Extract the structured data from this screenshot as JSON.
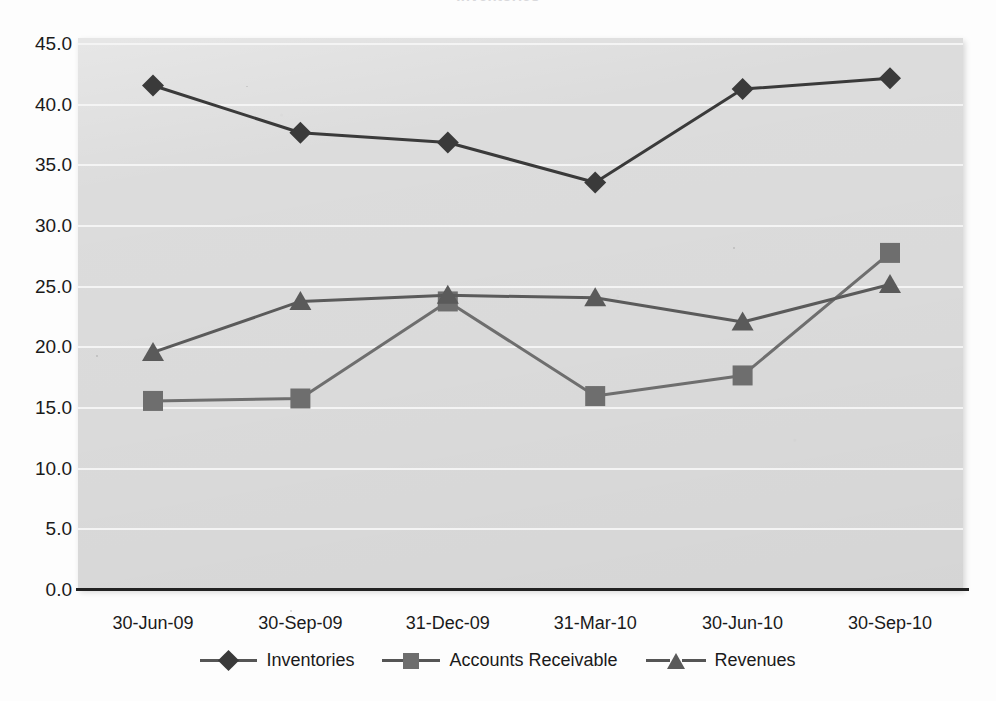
{
  "chart_data": {
    "type": "line",
    "title": "Inventories",
    "title_visible_fragment": "Inventories",
    "xlabel": "",
    "ylabel": "",
    "ylim": [
      0.0,
      45.0
    ],
    "y_ticks": [
      "45.0",
      "40.0",
      "35.0",
      "30.0",
      "25.0",
      "20.0",
      "15.0",
      "10.0",
      "5.0",
      "0.0"
    ],
    "y_tick_values": [
      45.0,
      40.0,
      35.0,
      30.0,
      25.0,
      20.0,
      15.0,
      10.0,
      5.0,
      0.0
    ],
    "grid": true,
    "grid_axis": "y",
    "legend_position": "bottom",
    "categories": [
      "30-Jun-09",
      "30-Sep-09",
      "31-Dec-09",
      "31-Mar-10",
      "30-Jun-10",
      "30-Sep-10"
    ],
    "series": [
      {
        "name": "Inventories",
        "marker": "diamond",
        "color": "#3a3a3a",
        "values": [
          41.5,
          37.6,
          36.8,
          33.5,
          41.2,
          42.1
        ]
      },
      {
        "name": "Accounts Receivable",
        "marker": "square",
        "color": "#6e6e6e",
        "values": [
          15.5,
          15.7,
          23.7,
          15.9,
          17.6,
          27.7
        ]
      },
      {
        "name": "Revenues",
        "marker": "triangle",
        "color": "#5a5a5a",
        "values": [
          19.5,
          23.7,
          24.2,
          24.0,
          22.0,
          25.1
        ]
      }
    ]
  },
  "legend": {
    "items": [
      {
        "label": "Inventories",
        "marker": "diamond"
      },
      {
        "label": "Accounts Receivable",
        "marker": "square"
      },
      {
        "label": "Revenues",
        "marker": "triangle"
      }
    ]
  },
  "colors": {
    "plot_background": "#dcdcdc",
    "gridline": "#f4f4f4",
    "axis": "#222222",
    "text": "#1a1a1a",
    "series_inventories": "#3a3a3a",
    "series_accounts_receivable": "#6e6e6e",
    "series_revenues": "#5a5a5a"
  }
}
